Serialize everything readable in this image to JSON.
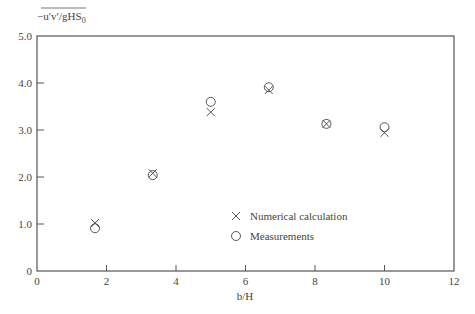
{
  "chart_data": {
    "type": "scatter",
    "title": "",
    "xlabel": "b/H",
    "ylabel": "-u'v'/gHS0",
    "xlim": [
      0,
      12
    ],
    "ylim": [
      0,
      5.0
    ],
    "x_ticks": [
      "0",
      "2",
      "4",
      "6",
      "8",
      "10",
      "12"
    ],
    "y_ticks": [
      "0",
      "1.0",
      "2.0",
      "3.0",
      "4.0",
      "5.0"
    ],
    "grid": false,
    "legend_position": "inside-lower-center",
    "series": [
      {
        "name": "Numerical calculation",
        "marker": "x",
        "x": [
          1.67,
          3.33,
          5.0,
          6.67,
          8.33,
          10.0
        ],
        "y": [
          1.02,
          2.08,
          3.38,
          3.85,
          3.13,
          2.94
        ]
      },
      {
        "name": "Measurements",
        "marker": "circle",
        "x": [
          1.67,
          3.33,
          5.0,
          6.67,
          8.33,
          10.0
        ],
        "y": [
          0.91,
          2.04,
          3.6,
          3.91,
          3.13,
          3.06
        ]
      }
    ]
  },
  "labels": {
    "ylabel_main": "−u′v′/gHS",
    "ylabel_sub": "0",
    "xlabel": "b/H",
    "legend_x": "Numerical calculation",
    "legend_o": "Measurements"
  }
}
